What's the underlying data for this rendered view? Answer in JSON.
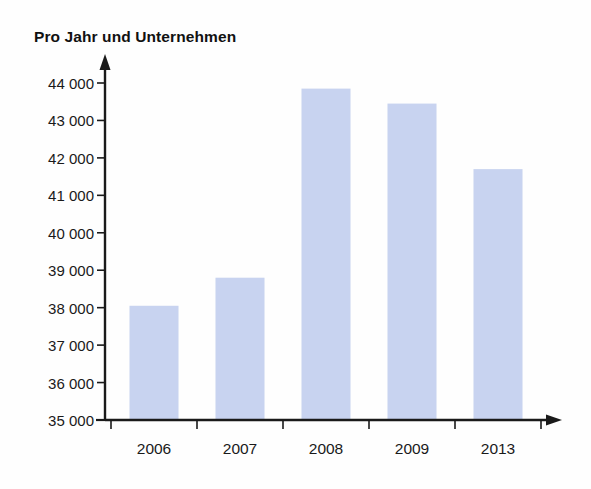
{
  "chart_data": {
    "type": "bar",
    "title": "Pro Jahr und Unternehmen",
    "xlabel": "",
    "ylabel": "",
    "categories": [
      "2006",
      "2007",
      "2008",
      "2009",
      "2013"
    ],
    "values": [
      38050,
      38800,
      43850,
      43450,
      41700
    ],
    "ylim": [
      35000,
      44000
    ],
    "yticks": [
      35000,
      36000,
      37000,
      38000,
      39000,
      40000,
      41000,
      42000,
      43000,
      44000
    ],
    "ytick_labels": [
      "35 000",
      "36 000",
      "37 000",
      "38 000",
      "39 000",
      "40 000",
      "41 000",
      "42 000",
      "43 000",
      "44 000"
    ],
    "grid": false,
    "legend": null,
    "legend_position": "none",
    "bar_color": "#c6d2ef",
    "axis_color": "#1a1a1a",
    "background_color": "#ffffff"
  },
  "layout": {
    "plot_left": 105,
    "plot_right": 555,
    "baseline_y": 420,
    "top_value_y": 83,
    "bar_width": 49,
    "bar_slot_width": 86,
    "first_bar_center": 154
  },
  "axes": {
    "y_axis_name": "value-axis",
    "x_axis_name": "category-axis",
    "y_arrow": "arrow-up",
    "x_arrow": "arrow-right"
  }
}
